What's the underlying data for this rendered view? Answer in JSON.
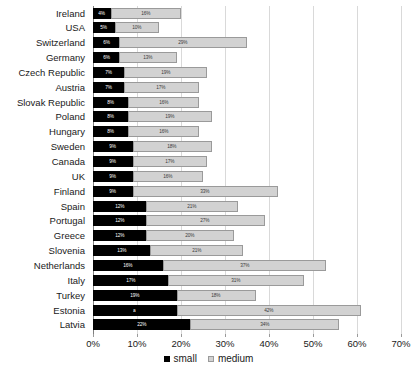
{
  "chart_data": {
    "type": "bar",
    "orientation": "horizontal",
    "stacked": true,
    "title": "",
    "subtitle": "",
    "xlabel": "",
    "ylabel": "",
    "xlim": [
      0,
      70
    ],
    "xtick_labels": [
      "0%",
      "10%",
      "20%",
      "30%",
      "40%",
      "50%",
      "60%",
      "70%"
    ],
    "xtick_values": [
      0,
      10,
      20,
      30,
      40,
      50,
      60,
      70
    ],
    "grid": true,
    "legend_position": "bottom",
    "value_label_suffix": "%",
    "categories": [
      "Ireland",
      "USA",
      "Switzerland",
      "Germany",
      "Czech Republic",
      "Austria",
      "Slovak Republic",
      "Poland",
      "Hungary",
      "Sweden",
      "Canada",
      "UK",
      "Finland",
      "Spain",
      "Portugal",
      "Greece",
      "Slovenia",
      "Netherlands",
      "Italy",
      "Turkey",
      "Estonia",
      "Latvia"
    ],
    "series": [
      {
        "name": "small",
        "color": "#000000",
        "values": [
          4,
          5,
          6,
          6,
          7,
          7,
          8,
          8,
          8,
          9,
          9,
          9,
          9,
          12,
          12,
          12,
          13,
          16,
          17,
          19,
          19,
          22
        ],
        "labels": [
          "4%",
          "5%",
          "6%",
          "6%",
          "7%",
          "7%",
          "8%",
          "8%",
          "8%",
          "9%",
          "9%",
          "9%",
          "9%",
          "12%",
          "12%",
          "12%",
          "13%",
          "16%",
          "17%",
          "19%",
          "a",
          "22%"
        ]
      },
      {
        "name": "medium",
        "color": "#d2d2d2",
        "values": [
          16,
          10,
          29,
          13,
          19,
          17,
          16,
          19,
          16,
          18,
          17,
          16,
          33,
          21,
          27,
          20,
          21,
          37,
          31,
          18,
          42,
          34
        ],
        "labels": [
          "16%",
          "10%",
          "29%",
          "13%",
          "19%",
          "17%",
          "16%",
          "19%",
          "16%",
          "18%",
          "17%",
          "16%",
          "33%",
          "21%",
          "27%",
          "20%",
          "21%",
          "37%",
          "31%",
          "18%",
          "42%",
          "34%"
        ]
      }
    ],
    "legend": [
      {
        "label": "small",
        "color": "#000000"
      },
      {
        "label": "medium",
        "color": "#d2d2d2"
      }
    ]
  }
}
